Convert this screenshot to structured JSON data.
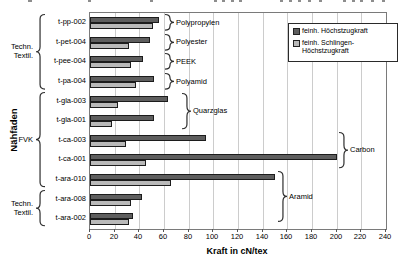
{
  "chart_data": {
    "type": "bar",
    "orientation": "horizontal",
    "xlabel": "Kraft in cN/tex",
    "ylabel": "Nähfäden",
    "xlim": [
      0,
      240
    ],
    "xticks": [
      0,
      20,
      40,
      60,
      80,
      100,
      120,
      140,
      160,
      180,
      200,
      220,
      240
    ],
    "grid": true,
    "legend_position": "top-right-inside",
    "categories": [
      "t-pp-002",
      "t-pet-004",
      "t-pee-004",
      "t-pa-004",
      "t-gla-003",
      "t-gla-001",
      "t-ca-003",
      "t-ca-001",
      "t-ara-010",
      "t-ara-008",
      "t-ara-002"
    ],
    "series": [
      {
        "name": "feinh. Höchstzugkraft",
        "color": "#5e5e5e",
        "values": [
          56,
          49,
          43,
          52,
          63,
          52,
          94,
          200,
          150,
          42,
          35
        ]
      },
      {
        "name": "feinh. Schlingen-Höchstzugkraft",
        "color": "#b9b9b9",
        "values": [
          51,
          32,
          33,
          37,
          23,
          18,
          29,
          45,
          66,
          33,
          32
        ]
      }
    ],
    "left_groups": [
      {
        "lines": [
          "Techn.",
          "Textil."
        ],
        "from_row": 0,
        "to_row": 3
      },
      {
        "lines": [
          "FVK"
        ],
        "from_row": 4,
        "to_row": 8
      },
      {
        "lines": [
          "Techn.",
          "Textil."
        ],
        "from_row": 9,
        "to_row": 10
      }
    ],
    "right_groups": [
      {
        "label": "Polypropylen",
        "from_row": 0,
        "to_row": 0
      },
      {
        "label": "Polyester",
        "from_row": 1,
        "to_row": 1
      },
      {
        "label": "PEEK",
        "from_row": 2,
        "to_row": 2
      },
      {
        "label": "Polyamid",
        "from_row": 3,
        "to_row": 3
      },
      {
        "label": "Quarzglas",
        "from_row": 4,
        "to_row": 5
      },
      {
        "label": "Carbon",
        "from_row": 6,
        "to_row": 7
      },
      {
        "label": "Aramid",
        "from_row": 8,
        "to_row": 10
      }
    ]
  },
  "legend": {
    "entries": [
      {
        "lines": [
          "feinh. Höchstzugkraft"
        ],
        "color": "#5e5e5e"
      },
      {
        "lines": [
          "feinh. Schlingen-",
          "Höchstzugkraft"
        ],
        "color": "#b9b9b9"
      }
    ]
  },
  "colors": {
    "bar_border": "#1c1c1c",
    "gridline": "#cccccc",
    "plot_border": "#7a7a7a",
    "brace": "#2e2e2e",
    "text": "#000000"
  }
}
